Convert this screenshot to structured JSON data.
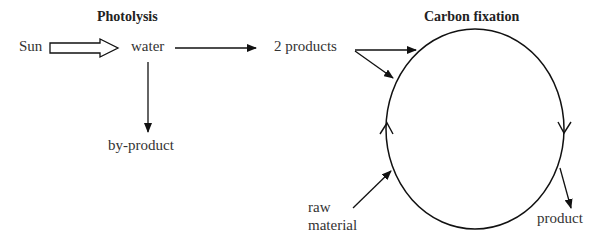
{
  "titles": {
    "photolysis": "Photolysis",
    "carbon_fixation": "Carbon fixation"
  },
  "labels": {
    "sun": "Sun",
    "water": "water",
    "two_products": "2 products",
    "by_product": "by-product",
    "raw_line1": "raw",
    "raw_line2": "material",
    "product": "product"
  },
  "colors": {
    "stroke": "#111111",
    "text": "#333333"
  }
}
